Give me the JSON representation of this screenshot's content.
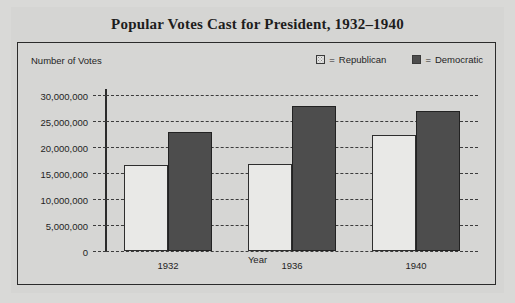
{
  "chart_data": {
    "type": "bar",
    "title": "Popular Votes Cast for President, 1932–1940",
    "xlabel": "Year",
    "ylabel": "Number of Votes",
    "categories": [
      "1932",
      "1936",
      "1940"
    ],
    "series": [
      {
        "name": "Republican",
        "values": [
          16500000,
          16700000,
          22300000
        ],
        "swatch": "stipple-light",
        "color": "#e9e9e7"
      },
      {
        "name": "Democratic",
        "values": [
          22800000,
          27800000,
          27000000
        ],
        "swatch": "solid-dark",
        "color": "#4d4d4d"
      }
    ],
    "ylim": [
      0,
      30000000
    ],
    "ytick_step": 5000000,
    "ytick_labels": [
      "30,000,000",
      "25,000,000",
      "20,000,000",
      "15,000,000",
      "10,000,000",
      "5,000,000",
      "0"
    ],
    "ytick_values": [
      30000000,
      25000000,
      20000000,
      15000000,
      10000000,
      5000000,
      0
    ],
    "grid": "horizontal-dashed",
    "legend_position": "top-right",
    "legend": [
      {
        "marker": "=",
        "label": "Republican"
      },
      {
        "marker": "=",
        "label": "Democratic"
      }
    ]
  },
  "legend_equals": "=",
  "colors": {
    "page_background": "#d9d9d7",
    "card_background": "#d5d5d3",
    "plot_border": "#2b2b2b",
    "text": "#1f1f1f",
    "grid": "#3c3c3c",
    "republican_fill": "#e9e9e7",
    "democratic_fill": "#4d4d4d"
  }
}
